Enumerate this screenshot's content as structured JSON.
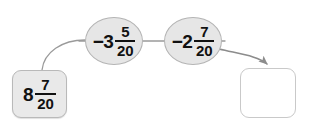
{
  "diagram": {
    "type": "flow-chain",
    "background_color": "#ffffff",
    "nodes": [
      {
        "id": "start",
        "shape": "rounded-box",
        "fill_color": "#e9e9e9",
        "border_color": "#b9b9b9",
        "value": {
          "kind": "mixed-number",
          "sign": "",
          "whole": "8",
          "numerator": "7",
          "denominator": "20",
          "text": "8 7/20"
        }
      },
      {
        "id": "op1",
        "shape": "ellipse",
        "fill_color": "#e6e6e6",
        "border_color": "#b4b4b4",
        "value": {
          "kind": "mixed-number",
          "sign": "−",
          "whole": "3",
          "numerator": "5",
          "denominator": "20",
          "text": "−3 5/20"
        }
      },
      {
        "id": "op2",
        "shape": "ellipse",
        "fill_color": "#e6e6e6",
        "border_color": "#b4b4b4",
        "value": {
          "kind": "mixed-number",
          "sign": "−",
          "whole": "2",
          "numerator": "7",
          "denominator": "20",
          "text": "−2 7/20"
        }
      },
      {
        "id": "result",
        "shape": "rounded-box",
        "fill_color": "#ffffff",
        "border_color": "#c9c9c9",
        "value": {
          "kind": "empty",
          "text": ""
        }
      }
    ],
    "connectors": [
      {
        "id": "start-to-op1",
        "from": "start",
        "to": "op1",
        "style": "curved",
        "arrowhead": false,
        "color": "#9a9a9a"
      },
      {
        "id": "op1-to-op2",
        "from": "op1",
        "to": "op2",
        "style": "straight",
        "arrowhead": false,
        "color": "#9a9a9a"
      },
      {
        "id": "op2-to-result",
        "from": "op2",
        "to": "result",
        "style": "curved",
        "arrowhead": true,
        "color": "#8c8c8c"
      }
    ]
  }
}
